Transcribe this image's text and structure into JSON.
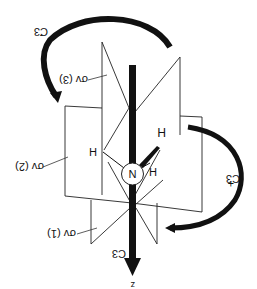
{
  "diagram": {
    "orientation": "rotated 180 degrees",
    "atoms": {
      "central": "N",
      "hydrogens": [
        "H",
        "H",
        "H"
      ]
    },
    "axis": {
      "label": "C3",
      "direction_label": "z"
    },
    "rotations": {
      "clockwise_label": "C3",
      "clockwise_mark": "-",
      "counterclockwise_label": "C3",
      "counterclockwise_mark": "+"
    },
    "planes": [
      {
        "label": "σv (1)"
      },
      {
        "label": "σv (2)"
      },
      {
        "label": "σv (3)"
      }
    ],
    "colors": {
      "ink": "#111111",
      "background": "#ffffff"
    }
  }
}
